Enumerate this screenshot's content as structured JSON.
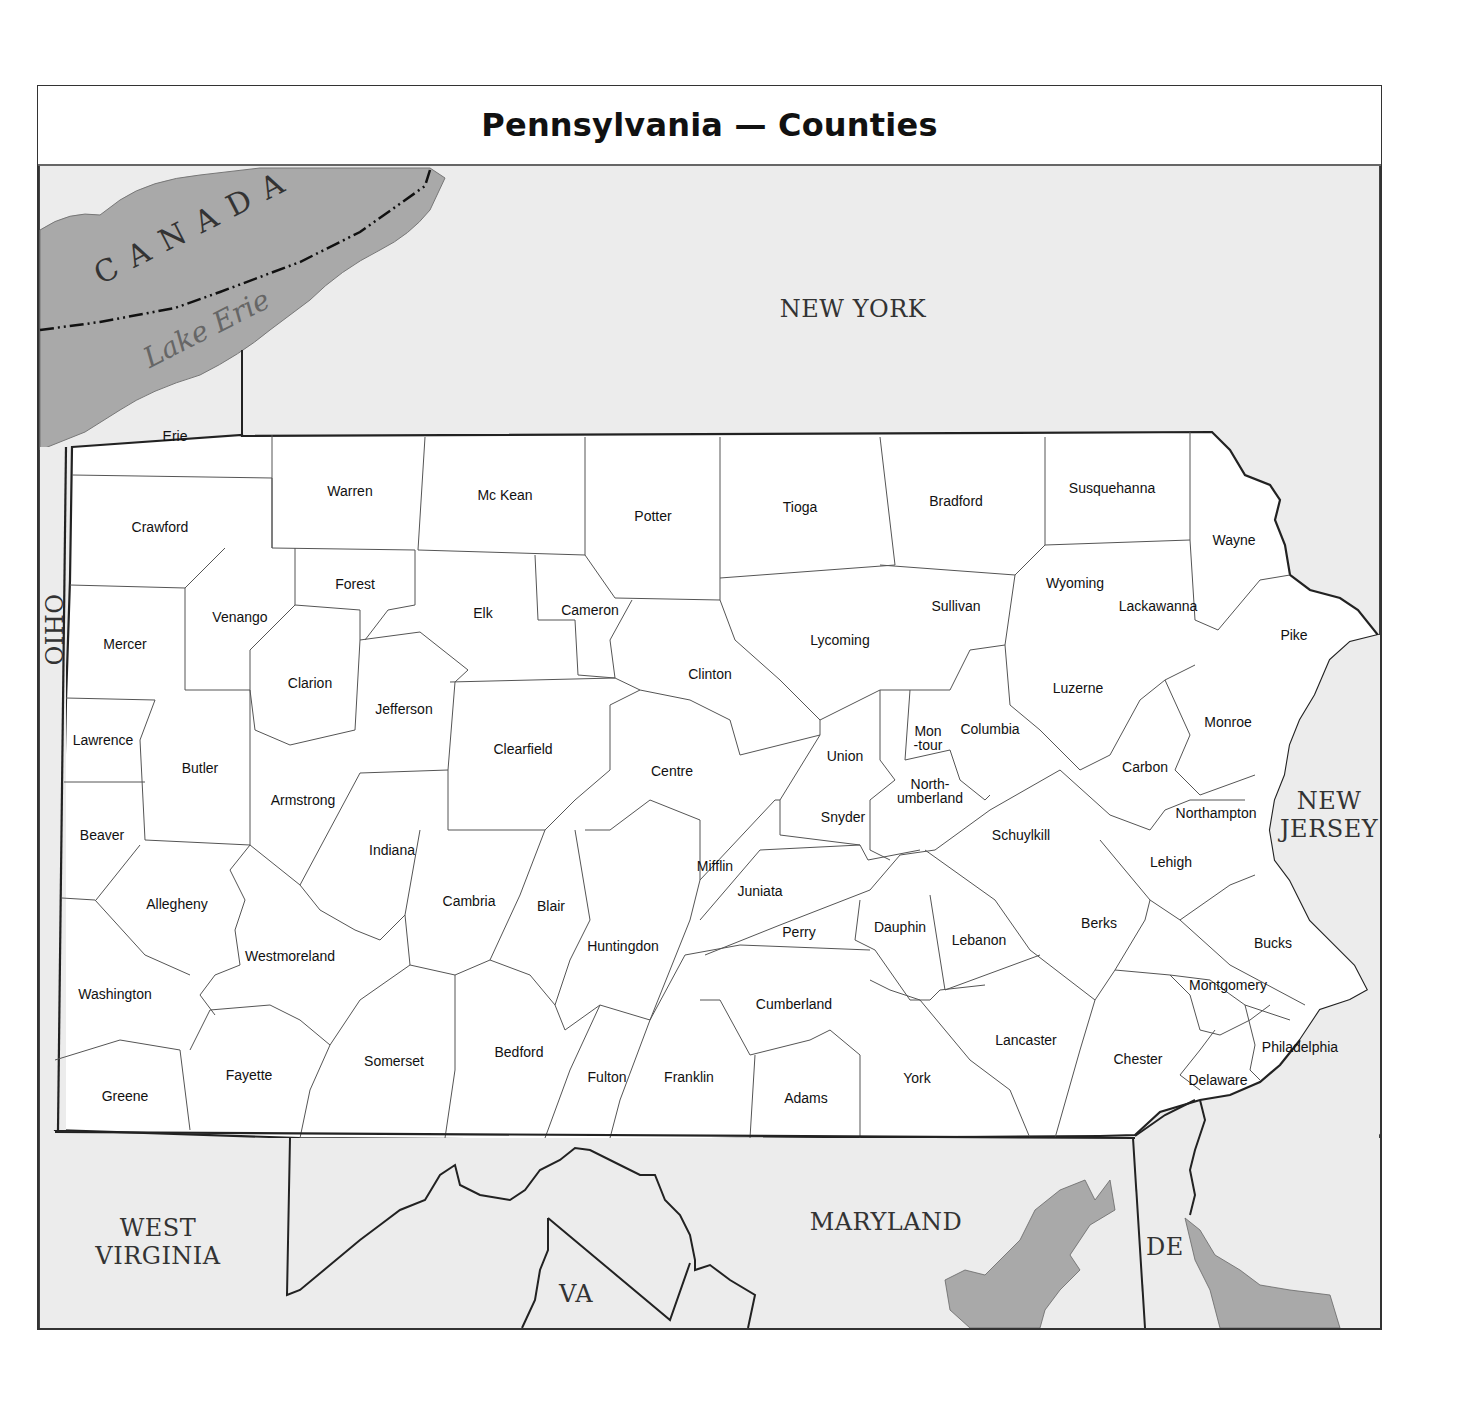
{
  "title": "Pennsylvania — Counties",
  "colors": {
    "land_outside": "#ececec",
    "water": "#a9a9a9",
    "county_fill": "#ffffff",
    "border": "#333333"
  },
  "neighbors": {
    "new_york": "NEW YORK",
    "ohio": "OHIO",
    "west_virginia": "WEST\nVIRGINIA",
    "maryland": "MARYLAND",
    "virginia": "VA",
    "delaware": "DE",
    "new_jersey": "NEW\nJERSEY",
    "canada": "CANADA"
  },
  "water": {
    "lake_erie": "Lake Erie"
  },
  "counties": [
    {
      "name": "Erie",
      "x": 175,
      "y": 436
    },
    {
      "name": "Crawford",
      "x": 160,
      "y": 527
    },
    {
      "name": "Warren",
      "x": 350,
      "y": 491
    },
    {
      "name": "Mc Kean",
      "x": 505,
      "y": 495
    },
    {
      "name": "Potter",
      "x": 653,
      "y": 516
    },
    {
      "name": "Tioga",
      "x": 800,
      "y": 507
    },
    {
      "name": "Bradford",
      "x": 956,
      "y": 501
    },
    {
      "name": "Susquehanna",
      "x": 1112,
      "y": 488
    },
    {
      "name": "Wayne",
      "x": 1234,
      "y": 540
    },
    {
      "name": "Mercer",
      "x": 125,
      "y": 644
    },
    {
      "name": "Venango",
      "x": 240,
      "y": 617
    },
    {
      "name": "Forest",
      "x": 355,
      "y": 584
    },
    {
      "name": "Elk",
      "x": 483,
      "y": 613
    },
    {
      "name": "Cameron",
      "x": 590,
      "y": 610
    },
    {
      "name": "Clinton",
      "x": 710,
      "y": 674
    },
    {
      "name": "Lycoming",
      "x": 840,
      "y": 640
    },
    {
      "name": "Sullivan",
      "x": 956,
      "y": 606
    },
    {
      "name": "Wyoming",
      "x": 1075,
      "y": 583
    },
    {
      "name": "Lackawanna",
      "x": 1158,
      "y": 606
    },
    {
      "name": "Pike",
      "x": 1294,
      "y": 635
    },
    {
      "name": "Clarion",
      "x": 310,
      "y": 683
    },
    {
      "name": "Jefferson",
      "x": 404,
      "y": 709
    },
    {
      "name": "Clearfield",
      "x": 523,
      "y": 749
    },
    {
      "name": "Centre",
      "x": 672,
      "y": 771
    },
    {
      "name": "Union",
      "x": 845,
      "y": 756
    },
    {
      "name": "Mon\n-tour",
      "x": 928,
      "y": 738
    },
    {
      "name": "Columbia",
      "x": 990,
      "y": 729
    },
    {
      "name": "Luzerne",
      "x": 1078,
      "y": 688
    },
    {
      "name": "Monroe",
      "x": 1228,
      "y": 722
    },
    {
      "name": "Lawrence",
      "x": 103,
      "y": 740
    },
    {
      "name": "Butler",
      "x": 200,
      "y": 768
    },
    {
      "name": "Armstrong",
      "x": 303,
      "y": 800
    },
    {
      "name": "North-\numberland",
      "x": 930,
      "y": 791
    },
    {
      "name": "Carbon",
      "x": 1145,
      "y": 767
    },
    {
      "name": "Beaver",
      "x": 102,
      "y": 835
    },
    {
      "name": "Indiana",
      "x": 392,
      "y": 850
    },
    {
      "name": "Snyder",
      "x": 843,
      "y": 817
    },
    {
      "name": "Schuylkill",
      "x": 1021,
      "y": 835
    },
    {
      "name": "Northampton",
      "x": 1216,
      "y": 813
    },
    {
      "name": "Mifflin",
      "x": 715,
      "y": 866
    },
    {
      "name": "Lehigh",
      "x": 1171,
      "y": 862
    },
    {
      "name": "Allegheny",
      "x": 177,
      "y": 904
    },
    {
      "name": "Cambria",
      "x": 469,
      "y": 901
    },
    {
      "name": "Blair",
      "x": 551,
      "y": 906
    },
    {
      "name": "Juniata",
      "x": 760,
      "y": 891
    },
    {
      "name": "Perry",
      "x": 799,
      "y": 932
    },
    {
      "name": "Dauphin",
      "x": 900,
      "y": 927
    },
    {
      "name": "Berks",
      "x": 1099,
      "y": 923
    },
    {
      "name": "Bucks",
      "x": 1273,
      "y": 943
    },
    {
      "name": "Huntingdon",
      "x": 623,
      "y": 946
    },
    {
      "name": "Lebanon",
      "x": 979,
      "y": 940
    },
    {
      "name": "Westmoreland",
      "x": 290,
      "y": 956
    },
    {
      "name": "Washington",
      "x": 115,
      "y": 994
    },
    {
      "name": "Cumberland",
      "x": 794,
      "y": 1004
    },
    {
      "name": "Montgomery",
      "x": 1228,
      "y": 985
    },
    {
      "name": "Lancaster",
      "x": 1026,
      "y": 1040
    },
    {
      "name": "Bedford",
      "x": 519,
      "y": 1052
    },
    {
      "name": "Philadelphia",
      "x": 1300,
      "y": 1047
    },
    {
      "name": "Somerset",
      "x": 394,
      "y": 1061
    },
    {
      "name": "Chester",
      "x": 1138,
      "y": 1059
    },
    {
      "name": "Fayette",
      "x": 249,
      "y": 1075
    },
    {
      "name": "Fulton",
      "x": 607,
      "y": 1077
    },
    {
      "name": "Franklin",
      "x": 689,
      "y": 1077
    },
    {
      "name": "York",
      "x": 917,
      "y": 1078
    },
    {
      "name": "Delaware",
      "x": 1218,
      "y": 1080
    },
    {
      "name": "Greene",
      "x": 125,
      "y": 1096
    },
    {
      "name": "Adams",
      "x": 806,
      "y": 1098
    }
  ]
}
